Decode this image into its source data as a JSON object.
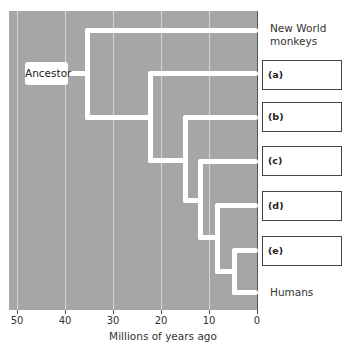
{
  "diagram": {
    "type": "phylogenetic-tree",
    "root_label": "Ancestor",
    "taxa": [
      {
        "label": "New World monkeys",
        "line1": "New World",
        "line2": "monkeys"
      },
      {
        "label": "(a)"
      },
      {
        "label": "(b)"
      },
      {
        "label": "(c)"
      },
      {
        "label": "(d)"
      },
      {
        "label": "(e)"
      },
      {
        "label": "Humans"
      }
    ],
    "branch_points_mya": [
      35,
      22,
      15,
      12,
      8,
      5
    ],
    "x_axis": {
      "label": "Millions of years ago",
      "ticks": [
        "50",
        "40",
        "30",
        "20",
        "10",
        "0"
      ]
    },
    "colors": {
      "background": "#a6a6a6",
      "branch": "#ffffff",
      "gridline": "#d4d4d4"
    }
  }
}
